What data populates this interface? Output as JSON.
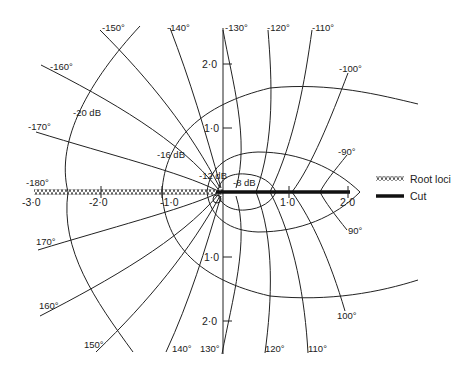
{
  "diagram": {
    "type": "root-locus-contour-plot",
    "axes": {
      "horizontal_ticks": [
        "-3·0",
        "-2·0",
        "-1·0",
        "0",
        "1·0",
        "2·0"
      ],
      "vertical_ticks_upper": [
        "2·0",
        "1·0"
      ],
      "vertical_ticks_lower": [
        "1·0",
        "2·0"
      ]
    },
    "phase_labels_upper": [
      "-150°",
      "-140°",
      "-130°",
      "-120°",
      "-110°",
      "-100°",
      "-90°",
      "-160°",
      "-170°",
      "-180°"
    ],
    "phase_labels_lower": [
      "170°",
      "160°",
      "150°",
      "140°",
      "130°",
      "120°",
      "110°",
      "100°",
      "90°"
    ],
    "gain_labels": [
      "-20 dB",
      "-16 dB",
      "-12 dB",
      "-8 dB"
    ],
    "legend": {
      "root_loci": "Root loci",
      "cut": "Cut"
    },
    "colors": {
      "line": "#222222",
      "background": "#ffffff"
    }
  }
}
